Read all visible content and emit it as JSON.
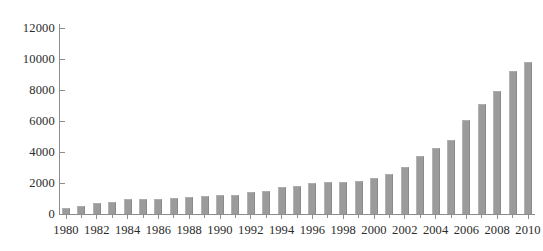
{
  "chart_data": {
    "type": "bar",
    "title": "",
    "subtitle": "",
    "xlabel": "",
    "ylabel": "",
    "xlim": [
      1979.3,
      2010.7
    ],
    "ylim": [
      0,
      12000
    ],
    "grid": false,
    "legend": null,
    "bar_color": "#9b9b9b",
    "axis_color": "#8d8d8d",
    "text_color": "#2b2b2b",
    "y_ticks": [
      0,
      2000,
      4000,
      6000,
      8000,
      10000,
      12000
    ],
    "y_tick_labels": [
      "0",
      "2000",
      "4000",
      "6000",
      "8000",
      "10000",
      "12000"
    ],
    "x_tick_labels": [
      "1980",
      "1982",
      "1984",
      "1986",
      "1988",
      "1990",
      "1992",
      "1994",
      "1996",
      "1998",
      "2000",
      "2002",
      "2004",
      "2006",
      "2008",
      "2010"
    ],
    "categories": [
      "1980",
      "1981",
      "1982",
      "1983",
      "1984",
      "1985",
      "1986",
      "1987",
      "1988",
      "1989",
      "1990",
      "1991",
      "1992",
      "1993",
      "1994",
      "1995",
      "1996",
      "1997",
      "1998",
      "1999",
      "2000",
      "2001",
      "2002",
      "2003",
      "2004",
      "2005",
      "2006",
      "2007",
      "2008",
      "2009",
      "2010"
    ],
    "values": [
      400,
      500,
      700,
      800,
      1000,
      950,
      1000,
      1050,
      1100,
      1150,
      1200,
      1250,
      1400,
      1500,
      1750,
      1800,
      2000,
      2050,
      2050,
      2100,
      2350,
      2600,
      3050,
      3750,
      4250,
      4800,
      6050,
      7100,
      7950,
      9200,
      9800
    ],
    "peak": {
      "category": "2009",
      "value": 9800
    },
    "last": {
      "category": "2010",
      "value": 7600
    }
  }
}
